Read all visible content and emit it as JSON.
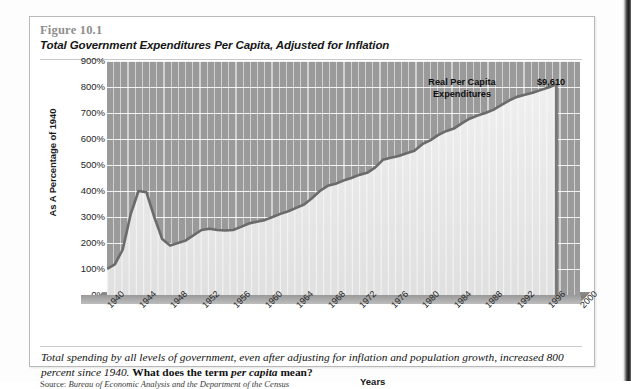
{
  "figure": {
    "number": "Figure 10.1",
    "title": "Total Government Expenditures Per Capita, Adjusted for Inflation",
    "source_prefix": "Source: ",
    "source": "Bureau of Economic Analysis and the Department of the Census",
    "caption_part1": "Total spending by all levels of government, even after adjusting for inflation and population growth, increased 800 percent since 1940. ",
    "caption_bold_a": "What does the term ",
    "caption_bold_italic": "per capita",
    "caption_bold_b": " mean?"
  },
  "colors": {
    "plot_background": "#9a9a9a",
    "gridline": "#ffffff",
    "area_fill": "#e8e8e8",
    "line": "#6b6b6b",
    "figure_number": "#8e8e8e",
    "text": "#161616",
    "page_edge": "#1c1c1c"
  },
  "chart_data": {
    "type": "area",
    "title": "Total Government Expenditures Per Capita, Adjusted for Inflation",
    "subtitle": "Figure 10.1",
    "xlabel": "Years",
    "ylabel": "As A Percentage of 1940",
    "grid": true,
    "legend_position": "none",
    "xlim": [
      1940,
      2000
    ],
    "ylim": [
      0,
      900
    ],
    "ytick_labels": [
      "900%",
      "800%",
      "700%",
      "600%",
      "500%",
      "400%",
      "300%",
      "200%",
      "100%",
      "0%"
    ],
    "ytick_values": [
      900,
      800,
      700,
      600,
      500,
      400,
      300,
      200,
      100,
      0
    ],
    "xtick_labels": [
      "1940",
      "1944",
      "1948",
      "1952",
      "1956",
      "1960",
      "1964",
      "1968",
      "1972",
      "1976",
      "1980",
      "1984",
      "1988",
      "1992",
      "1996",
      "2000"
    ],
    "xtick_values": [
      1940,
      1944,
      1948,
      1952,
      1956,
      1960,
      1964,
      1968,
      1972,
      1976,
      1980,
      1984,
      1988,
      1992,
      1996,
      2000
    ],
    "annotations": [
      {
        "name": "series-label",
        "text": "Real Per Capita\nExpenditures",
        "text_line1": "Real Per Capita",
        "text_line2": "Expenditures"
      },
      {
        "name": "endpoint-value",
        "text": "$9,610"
      }
    ],
    "series": [
      {
        "name": "Real Per Capita Expenditures",
        "unit": "percent of 1940",
        "x": [
          1940,
          1941,
          1942,
          1943,
          1944,
          1945,
          1946,
          1947,
          1948,
          1949,
          1950,
          1951,
          1952,
          1953,
          1954,
          1955,
          1956,
          1957,
          1958,
          1959,
          1960,
          1961,
          1962,
          1963,
          1964,
          1965,
          1966,
          1967,
          1968,
          1969,
          1970,
          1971,
          1972,
          1973,
          1974,
          1975,
          1976,
          1977,
          1978,
          1979,
          1980,
          1981,
          1982,
          1983,
          1984,
          1985,
          1986,
          1987,
          1988,
          1989,
          1990,
          1991,
          1992,
          1993,
          1994,
          1995,
          1996,
          1997
        ],
        "values": [
          100,
          118,
          175,
          310,
          400,
          395,
          300,
          215,
          190,
          200,
          210,
          230,
          250,
          255,
          250,
          248,
          250,
          262,
          275,
          282,
          288,
          300,
          312,
          322,
          335,
          348,
          372,
          400,
          420,
          428,
          440,
          450,
          462,
          470,
          490,
          520,
          528,
          535,
          545,
          555,
          580,
          595,
          615,
          630,
          640,
          660,
          678,
          690,
          700,
          712,
          730,
          748,
          762,
          770,
          778,
          788,
          798,
          810
        ]
      }
    ],
    "endpoint_label": "$9,610",
    "endpoint_value_percent": 810
  }
}
